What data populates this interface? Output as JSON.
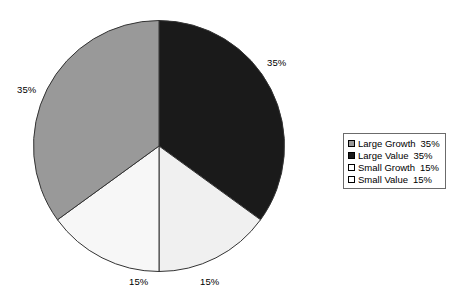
{
  "chart_data": {
    "type": "pie",
    "title": "",
    "labels": [
      "Large Growth",
      "Large Value",
      "Small Growth",
      "Small Value"
    ],
    "values": [
      35,
      35,
      15,
      15
    ],
    "value_labels": [
      "35%",
      "35%",
      "15%",
      "15%"
    ],
    "colors": [
      "#999999",
      "#1a1a1a",
      "#f7f7f7",
      "#f0f0f0"
    ],
    "legend_position": "right",
    "grid": false,
    "start_angle_deg": 0,
    "direction": "clockwise",
    "slices": [
      {
        "name": "Large Value",
        "value": 35,
        "value_label": "35%",
        "color": "#1a1a1a",
        "start_deg": 0,
        "end_deg": 126
      },
      {
        "name": "Small Value",
        "value": 15,
        "value_label": "15%",
        "color": "#f0f0f0",
        "start_deg": 126,
        "end_deg": 180
      },
      {
        "name": "Small Growth",
        "value": 15,
        "value_label": "15%",
        "color": "#f7f7f7",
        "start_deg": 180,
        "end_deg": 234
      },
      {
        "name": "Large Growth",
        "value": 35,
        "value_label": "35%",
        "color": "#999999",
        "start_deg": 234,
        "end_deg": 360
      }
    ]
  },
  "legend": {
    "items": [
      {
        "label": "Large Growth",
        "value": "35%",
        "swatch": "#999999"
      },
      {
        "label": "Large Value",
        "value": "35%",
        "swatch": "#1a1a1a"
      },
      {
        "label": "Small Growth",
        "value": "15%",
        "swatch": "#ffffff"
      },
      {
        "label": "Small Value",
        "value": "15%",
        "swatch": "#ffffff"
      }
    ]
  },
  "outline_color": "#333333"
}
